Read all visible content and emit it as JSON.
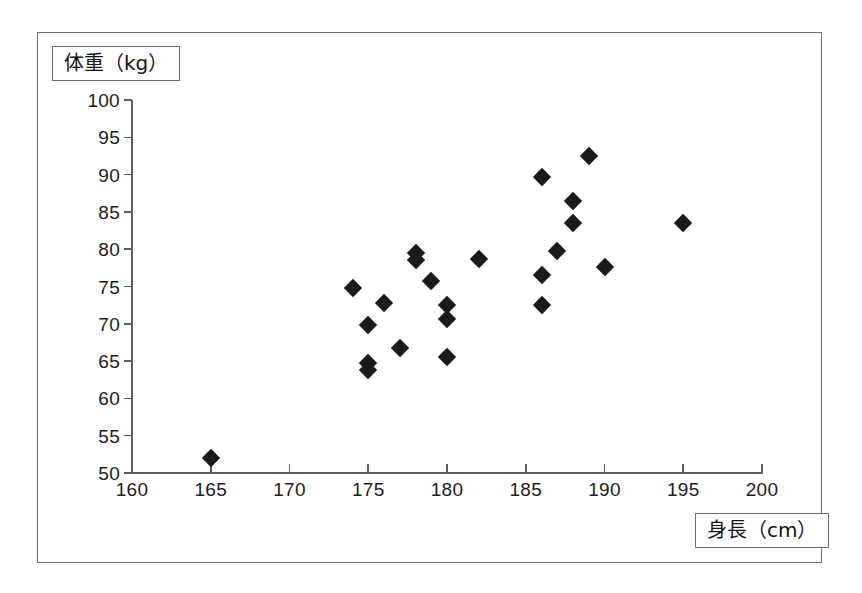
{
  "chart_data": {
    "type": "scatter",
    "title": "",
    "subtitle": "",
    "xlabel": "身長（cm）",
    "ylabel": "体重（kg）",
    "xlim": [
      160,
      200
    ],
    "ylim": [
      50,
      100
    ],
    "xticks": [
      160,
      165,
      170,
      175,
      180,
      185,
      190,
      195,
      200
    ],
    "yticks": [
      50,
      55,
      60,
      65,
      70,
      75,
      80,
      85,
      90,
      95,
      100
    ],
    "xtick_labels": [
      "160",
      "165",
      "170",
      "175",
      "180",
      "185",
      "190",
      "195",
      "200"
    ],
    "ytick_labels": [
      "50",
      "55",
      "60",
      "65",
      "70",
      "75",
      "80",
      "85",
      "90",
      "95",
      "100"
    ],
    "grid": false,
    "legend": false,
    "legend_position": "none",
    "marker": "diamond",
    "marker_color": "#1a1a1a",
    "axis_color": "#5d5d5d",
    "frame_color": "#6f6f6f",
    "series": [
      {
        "name": "身長と体重",
        "points": [
          {
            "x": 165.0,
            "y": 52.0
          },
          {
            "x": 174.0,
            "y": 74.8
          },
          {
            "x": 175.0,
            "y": 69.8
          },
          {
            "x": 175.0,
            "y": 64.8
          },
          {
            "x": 175.0,
            "y": 63.8
          },
          {
            "x": 176.0,
            "y": 72.8
          },
          {
            "x": 177.0,
            "y": 66.8
          },
          {
            "x": 178.0,
            "y": 79.5
          },
          {
            "x": 178.0,
            "y": 78.5
          },
          {
            "x": 179.0,
            "y": 75.7
          },
          {
            "x": 180.0,
            "y": 72.5
          },
          {
            "x": 180.0,
            "y": 70.7
          },
          {
            "x": 180.0,
            "y": 65.6
          },
          {
            "x": 182.0,
            "y": 78.7
          },
          {
            "x": 186.0,
            "y": 89.7
          },
          {
            "x": 186.0,
            "y": 76.6
          },
          {
            "x": 186.0,
            "y": 72.5
          },
          {
            "x": 187.0,
            "y": 79.7
          },
          {
            "x": 188.0,
            "y": 86.5
          },
          {
            "x": 188.0,
            "y": 83.5
          },
          {
            "x": 189.0,
            "y": 92.5
          },
          {
            "x": 190.0,
            "y": 77.6
          },
          {
            "x": 195.0,
            "y": 83.5
          }
        ]
      }
    ]
  }
}
